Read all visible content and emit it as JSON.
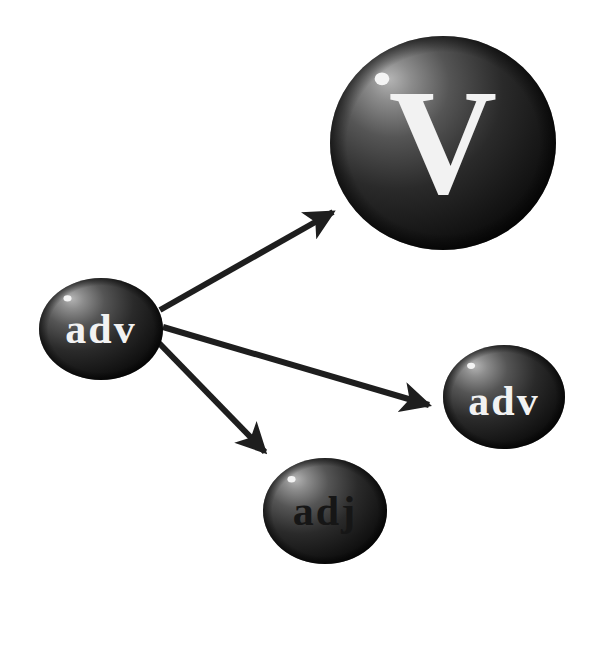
{
  "diagram": {
    "type": "word-dependency-graph",
    "colors": {
      "background": "#ffffff",
      "sphere_dark": "#0d0d0d",
      "sphere_mid": "#3a3a3a",
      "sphere_light": "#9a9a9a",
      "highlight": "#f4f4f4",
      "arrow": "#1e1e1e",
      "label_light": "#f2f2f2",
      "label_dark": "#161616"
    },
    "nodes": [
      {
        "id": "verb",
        "label": "V",
        "cx": 443,
        "cy": 143,
        "rx": 113,
        "ry": 107,
        "label_color": "light",
        "font_size": 150,
        "label_dy": 50
      },
      {
        "id": "adv-source",
        "label": "adv",
        "cx": 101,
        "cy": 329,
        "rx": 62,
        "ry": 51,
        "label_color": "light",
        "font_size": 42,
        "label_dy": 14
      },
      {
        "id": "adv-target",
        "label": "adv",
        "cx": 504,
        "cy": 397,
        "rx": 61,
        "ry": 52,
        "label_color": "light",
        "font_size": 42,
        "label_dy": 18
      },
      {
        "id": "adj-target",
        "label": "adj",
        "cx": 325,
        "cy": 511,
        "rx": 62,
        "ry": 53,
        "label_color": "dark",
        "font_size": 42,
        "label_dy": 14
      }
    ],
    "edges": [
      {
        "from": "adv-source",
        "to": "verb",
        "x1": 160,
        "y1": 310,
        "x2": 333,
        "y2": 212
      },
      {
        "from": "adv-source",
        "to": "adv-target",
        "x1": 163,
        "y1": 327,
        "x2": 429,
        "y2": 405
      },
      {
        "from": "adv-source",
        "to": "adj-target",
        "x1": 158,
        "y1": 342,
        "x2": 265,
        "y2": 452
      }
    ]
  }
}
